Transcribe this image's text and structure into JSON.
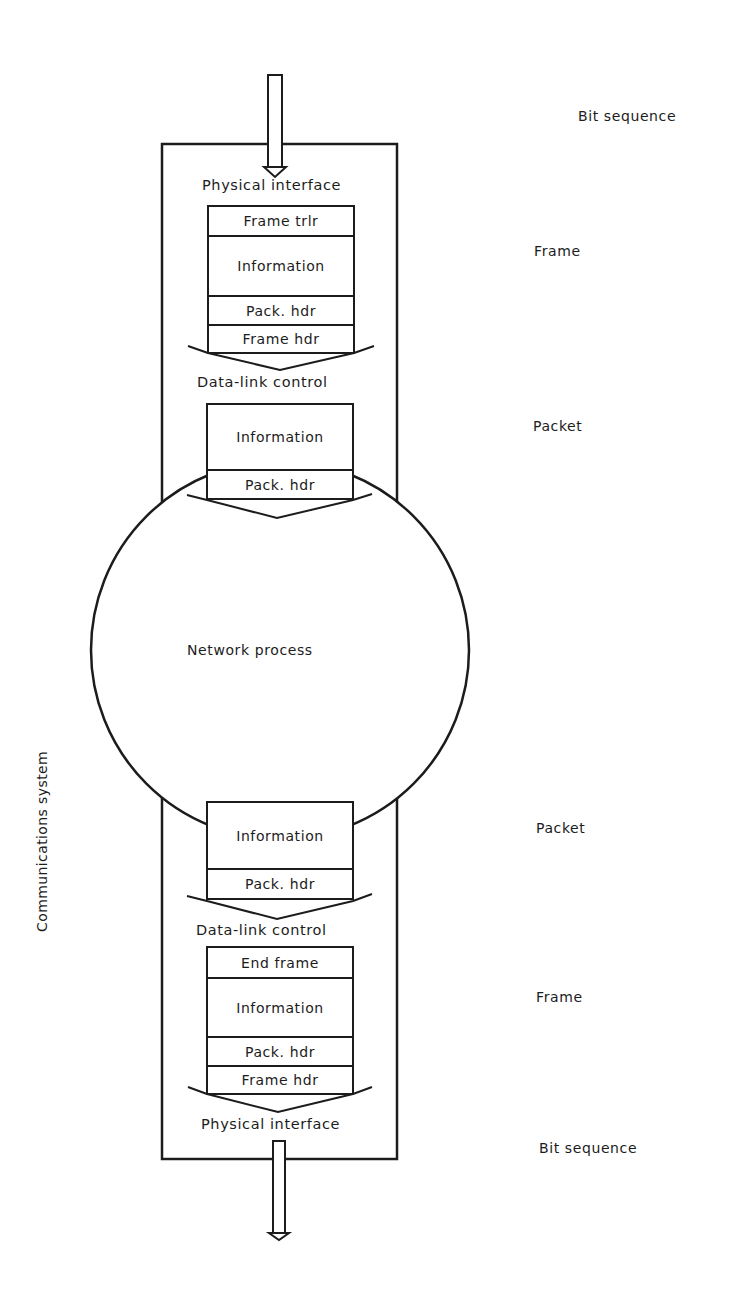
{
  "diagram": {
    "system_label": "Communications system",
    "center_process": "Network process",
    "top": {
      "input_layer": "Physical interface",
      "frame_cells": [
        "Frame trlr",
        "Information",
        "Pack. hdr",
        "Frame hdr"
      ],
      "datalink_layer": "Data-link control",
      "packet_cells": [
        "Information",
        "Pack. hdr"
      ]
    },
    "bottom": {
      "packet_cells": [
        "Information",
        "Pack. hdr"
      ],
      "datalink_layer": "Data-link control",
      "frame_cells": [
        "End frame",
        "Information",
        "Pack. hdr",
        "Frame hdr"
      ],
      "output_layer": "Physical interface"
    },
    "right_labels": {
      "top_bit_sequence": "Bit sequence",
      "top_frame": "Frame",
      "top_packet": "Packet",
      "bottom_packet": "Packet",
      "bottom_frame": "Frame",
      "bottom_bit_sequence": "Bit sequence"
    },
    "icons": {
      "input_arrow": "arrow-down-icon",
      "output_arrow": "arrow-down-icon",
      "chevrons": "chevron-down-icon"
    },
    "colors": {
      "ink": "#1c1c1c",
      "background": "#ffffff"
    }
  }
}
